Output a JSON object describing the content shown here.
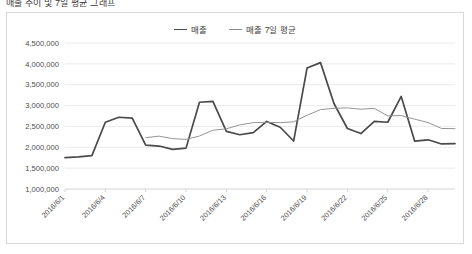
{
  "clipped_title": "매출 추이 및 7일 평균 그래프",
  "legend": {
    "position": "top-center",
    "items": [
      {
        "label": "매출",
        "color": "#4a4a4a",
        "style": "thick"
      },
      {
        "label": "매출 7일 평균",
        "color": "#8f8f8f",
        "style": "thin"
      }
    ]
  },
  "chart_data": {
    "type": "line",
    "title": "",
    "xlabel": "",
    "ylabel": "",
    "grid": true,
    "legend_position": "top-center",
    "ylim": [
      1000000,
      4500000
    ],
    "ytick_labels": [
      "4,500,000",
      "4,000,000",
      "3,500,000",
      "3,000,000",
      "2,500,000",
      "2,000,000",
      "1,500,000",
      "1,000,000"
    ],
    "ytick_values": [
      4500000,
      4000000,
      3500000,
      3000000,
      2500000,
      2000000,
      1500000,
      1000000
    ],
    "x": [
      "2016/6/1",
      "2016/6/2",
      "2016/6/3",
      "2016/6/4",
      "2016/6/5",
      "2016/6/6",
      "2016/6/7",
      "2016/6/8",
      "2016/6/9",
      "2016/6/10",
      "2016/6/11",
      "2016/6/12",
      "2016/6/13",
      "2016/6/14",
      "2016/6/15",
      "2016/6/16",
      "2016/6/17",
      "2016/6/18",
      "2016/6/19",
      "2016/6/20",
      "2016/6/21",
      "2016/6/22",
      "2016/6/23",
      "2016/6/24",
      "2016/6/25",
      "2016/6/26",
      "2016/6/27",
      "2016/6/28",
      "2016/6/29",
      "2016/6/30"
    ],
    "xtick_labels": [
      "2016/6/1",
      "2016/6/4",
      "2016/6/7",
      "2016/6/10",
      "2016/6/13",
      "2016/6/16",
      "2016/6/19",
      "2016/6/22",
      "2016/6/25",
      "2016/6/28"
    ],
    "xtick_indices": [
      0,
      3,
      6,
      9,
      12,
      15,
      18,
      21,
      24,
      27
    ],
    "xtick_rotation_deg": -45,
    "series": [
      {
        "name": "매출",
        "color": "#4a4a4a",
        "values": [
          1750000,
          1770000,
          1800000,
          2600000,
          2720000,
          2700000,
          2050000,
          2030000,
          1950000,
          1980000,
          3080000,
          3100000,
          2380000,
          2300000,
          2350000,
          2620000,
          2480000,
          2150000,
          3900000,
          4030000,
          3050000,
          2450000,
          2330000,
          2620000,
          2600000,
          3220000,
          2150000,
          2180000,
          2080000,
          2090000
        ]
      },
      {
        "name": "매출 7일 평균",
        "color": "#8f8f8f",
        "start_index": 6,
        "values": [
          null,
          null,
          null,
          null,
          null,
          null,
          2230000,
          2267000,
          2207000,
          2190000,
          2270000,
          2410000,
          2442000,
          2538000,
          2591000,
          2598000,
          2590000,
          2611000,
          2768000,
          2903000,
          2936000,
          2944000,
          2913000,
          2933000,
          2754000,
          2760000,
          2674000,
          2593000,
          2451000,
          2447000
        ]
      }
    ]
  }
}
